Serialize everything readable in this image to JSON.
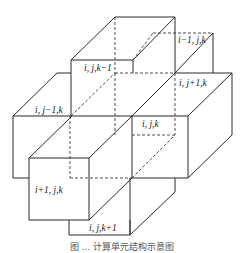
{
  "figure": {
    "type": "3d-grid-stencil",
    "labels": {
      "top": "i, j,k−1",
      "back": "i−1, j,k",
      "right": "i, j+1,k",
      "left": "i, j−1,k",
      "center": "i, j,k",
      "front": "i+1, j,k",
      "bottom": "i, j,k+1"
    },
    "caption": "图 ... 计算单元结构示意图"
  }
}
